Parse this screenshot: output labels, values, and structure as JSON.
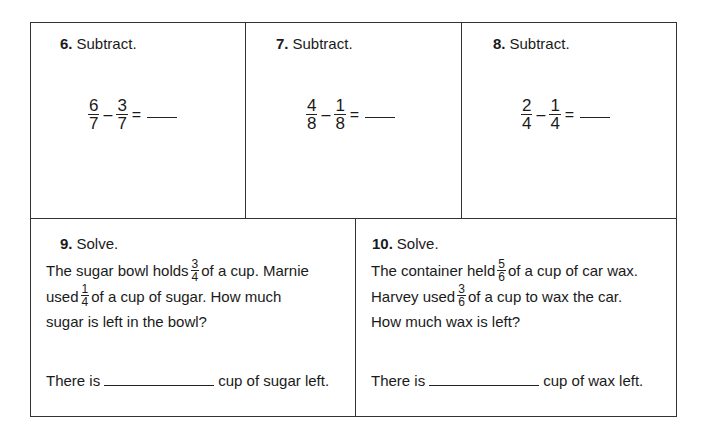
{
  "problems": [
    {
      "number": "6.",
      "instruction": "Subtract.",
      "a": {
        "num": "6",
        "den": "7"
      },
      "b": {
        "num": "3",
        "den": "7"
      },
      "op": "–",
      "eq": "="
    },
    {
      "number": "7.",
      "instruction": "Subtract.",
      "a": {
        "num": "4",
        "den": "8"
      },
      "b": {
        "num": "1",
        "den": "8"
      },
      "op": "–",
      "eq": "="
    },
    {
      "number": "8.",
      "instruction": "Subtract.",
      "a": {
        "num": "2",
        "den": "4"
      },
      "b": {
        "num": "1",
        "den": "4"
      },
      "op": "–",
      "eq": "="
    }
  ],
  "word_problems": [
    {
      "number": "9.",
      "instruction": "Solve.",
      "line1_pre": "The sugar bowl holds",
      "f1": {
        "num": "3",
        "den": "4"
      },
      "line1_post": "of a cup.  Marnie",
      "line2_pre": "used",
      "f2": {
        "num": "1",
        "den": "4"
      },
      "line2_post": "of a cup of sugar.  How much",
      "line3": "sugar is left in the bowl?",
      "answer_pre": "There is",
      "answer_post": "cup of sugar left."
    },
    {
      "number": "10.",
      "instruction": "Solve.",
      "line1_pre": "The container held",
      "f1": {
        "num": "5",
        "den": "6"
      },
      "line1_post": "of a cup of car wax.",
      "line2_pre": "Harvey used",
      "f2": {
        "num": "3",
        "den": "6"
      },
      "line2_post": "of a cup to wax the car.",
      "line3": "How much wax is left?",
      "answer_pre": "There is",
      "answer_post": "cup of wax left."
    }
  ]
}
